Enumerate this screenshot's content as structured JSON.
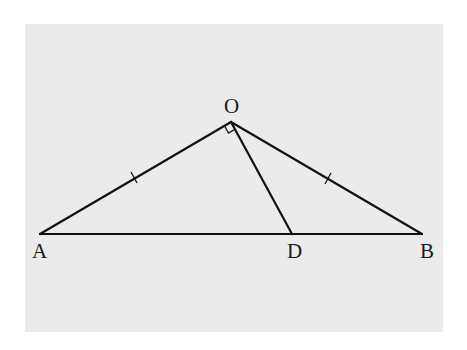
{
  "diagram": {
    "type": "geometry",
    "background_color": "#ebebeb",
    "line_color": "#111111",
    "points": {
      "O": {
        "label": "O",
        "x": 231,
        "y": 122
      },
      "A": {
        "label": "A",
        "x": 40,
        "y": 234
      },
      "B": {
        "label": "B",
        "x": 422,
        "y": 234
      },
      "D": {
        "label": "D",
        "x": 292,
        "y": 234
      }
    },
    "segments": [
      {
        "from": "A",
        "to": "O",
        "tick_marks": 1
      },
      {
        "from": "O",
        "to": "B",
        "tick_marks": 1
      },
      {
        "from": "A",
        "to": "B",
        "tick_marks": 0
      },
      {
        "from": "O",
        "to": "D",
        "tick_marks": 0
      }
    ],
    "right_angle_marker": {
      "vertex": "O",
      "between": [
        "A",
        "D"
      ]
    },
    "labels": {
      "O": "O",
      "A": "A",
      "B": "B",
      "D": "D"
    }
  }
}
